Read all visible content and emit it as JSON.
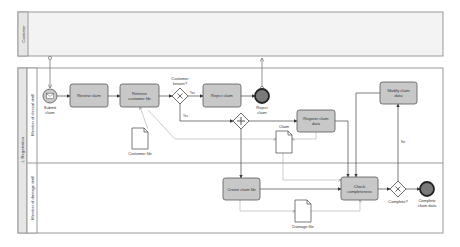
{
  "pools": {
    "customer": {
      "label": "Customer"
    },
    "registration": {
      "label": "1. Registration"
    }
  },
  "lanes": {
    "clerical": {
      "label": "Member of clerical staff"
    },
    "damage": {
      "label": "Member of damage staff"
    }
  },
  "events": {
    "start": {
      "label_line1": "Submit",
      "label_line2": "claim"
    },
    "reject_end": {
      "label_line1": "Reject",
      "label_line2": "claim"
    },
    "complete_end": {
      "label_line1": "Complete",
      "label_line2": "claim data"
    }
  },
  "tasks": {
    "review_claim": {
      "line1": "Review claim",
      "line2": ""
    },
    "retrieve_file": {
      "line1": "Retrieve",
      "line2": "customer file"
    },
    "reject_claim": {
      "line1": "Reject claim",
      "line2": ""
    },
    "register_claim": {
      "line1": "Register claim",
      "line2": "data"
    },
    "modify_claim": {
      "line1": "Modify claim",
      "line2": "data"
    },
    "create_claim_file": {
      "line1": "Create claim file",
      "line2": ""
    },
    "check_completeness": {
      "line1": "Check",
      "line2": "completeness"
    }
  },
  "gateways": {
    "customer_known": {
      "label_line1": "Customer",
      "label_line2": "known?",
      "yes_label": "Yes",
      "no_label": "Yes"
    },
    "complete": {
      "label": "Complete?",
      "no_label": "No"
    }
  },
  "documents": {
    "customer_file": {
      "label": "Customer file"
    },
    "claim": {
      "label": "Claim"
    },
    "damage_file": {
      "label": "Damage file"
    }
  },
  "colors": {
    "task_fill": "#c8c8c8",
    "task_stroke": "#555555",
    "end_fill": "#7a7a7a",
    "pool_header": "#e6e6e6",
    "line": "#666666"
  }
}
